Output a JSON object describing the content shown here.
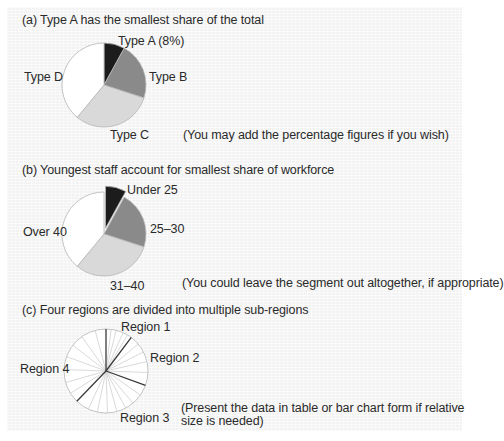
{
  "colors": {
    "black": "#1c1c1c",
    "dark_gray": "#8a8a8a",
    "light_gray": "#d9d9d9",
    "white": "#ffffff",
    "outline": "#b5b5b5",
    "dark_line": "#3a3a3a",
    "light_line": "#cfcfcf"
  },
  "sections": {
    "a": {
      "title": "(a) Type A has the smallest share of the total",
      "labels": {
        "A": "Type A (8%)",
        "B": "Type B",
        "C": "Type C",
        "D": "Type D"
      },
      "note": "(You may add the percentage figures if you wish)"
    },
    "b": {
      "title": "(b) Youngest staff account for smallest share of workforce",
      "labels": {
        "u25": "Under 25",
        "r2530": "25–30",
        "r3140": "31–40",
        "o40": "Over 40"
      },
      "note": "(You could leave the segment out altogether, if appropriate)"
    },
    "c": {
      "title": "(c) Four regions are divided into multiple sub-regions",
      "labels": {
        "r1": "Region 1",
        "r2": "Region 2",
        "r3": "Region 3",
        "r4": "Region 4"
      },
      "note_line1": "(Present the data in table or bar chart form if relative",
      "note_line2": "size is needed)"
    }
  },
  "chart_data": [
    {
      "type": "pie",
      "title": "(a) Type A has the smallest share of the total",
      "categories": [
        "Type A",
        "Type B",
        "Type C",
        "Type D"
      ],
      "values": [
        8,
        22,
        31,
        39
      ],
      "colors": [
        "#1c1c1c",
        "#8a8a8a",
        "#d9d9d9",
        "#ffffff"
      ],
      "annotation": "(You may add the percentage figures if you wish)"
    },
    {
      "type": "pie",
      "title": "(b) Youngest staff account for smallest share of workforce",
      "categories": [
        "Under 25",
        "25–30",
        "31–40",
        "Over 40"
      ],
      "values": [
        8,
        22,
        31,
        39
      ],
      "exploded": [
        "Under 25"
      ],
      "colors": [
        "#1c1c1c",
        "#8a8a8a",
        "#d9d9d9",
        "#ffffff"
      ],
      "annotation": "(You could leave the segment out altogether, if appropriate)"
    },
    {
      "type": "pie",
      "title": "(c) Four regions are divided into multiple sub-regions",
      "categories": [
        "Region 1",
        "Region 2",
        "Region 3",
        "Region 4"
      ],
      "values": [
        10,
        20,
        31,
        39
      ],
      "region_boundaries_deg": [
        0,
        37,
        110,
        224
      ],
      "subregion_boundaries_deg": [
        7,
        14,
        24,
        31,
        50,
        63,
        77,
        92,
        125,
        140,
        152,
        165,
        178,
        192,
        205,
        238,
        254,
        272,
        290,
        308,
        325,
        345
      ],
      "annotation": "(Present the data in table or bar chart form if relative size is needed)"
    }
  ]
}
